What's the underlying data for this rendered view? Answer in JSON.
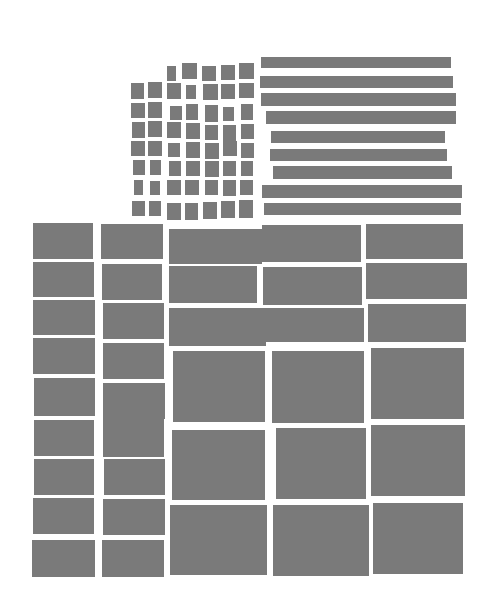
{
  "artwork": {
    "background": "#ffffff",
    "fill": "#7a7a7a",
    "small_squares": {
      "cols_x": [
        131,
        148,
        167,
        185,
        203,
        221,
        239
      ],
      "size": 15,
      "cells": [
        [
          167,
          66,
          9,
          15
        ],
        [
          182,
          63,
          15,
          16
        ],
        [
          202,
          66,
          14,
          15
        ],
        [
          221,
          65,
          14,
          15
        ],
        [
          239,
          63,
          15,
          16
        ],
        [
          131,
          83,
          13,
          16
        ],
        [
          148,
          82,
          14,
          16
        ],
        [
          167,
          83,
          14,
          16
        ],
        [
          186,
          85,
          10,
          14
        ],
        [
          203,
          84,
          15,
          16
        ],
        [
          221,
          84,
          14,
          15
        ],
        [
          239,
          83,
          15,
          15
        ],
        [
          131,
          103,
          14,
          15
        ],
        [
          148,
          102,
          14,
          16
        ],
        [
          170,
          106,
          12,
          14
        ],
        [
          186,
          104,
          12,
          16
        ],
        [
          205,
          105,
          13,
          17
        ],
        [
          223,
          107,
          11,
          14
        ],
        [
          241,
          104,
          12,
          16
        ],
        [
          132,
          122,
          13,
          16
        ],
        [
          148,
          121,
          14,
          16
        ],
        [
          167,
          122,
          14,
          16
        ],
        [
          186,
          123,
          14,
          16
        ],
        [
          205,
          125,
          13,
          15
        ],
        [
          223,
          125,
          13,
          16
        ],
        [
          241,
          124,
          13,
          15
        ],
        [
          131,
          141,
          14,
          15
        ],
        [
          148,
          141,
          14,
          15
        ],
        [
          168,
          143,
          12,
          14
        ],
        [
          186,
          142,
          14,
          16
        ],
        [
          205,
          143,
          14,
          16
        ],
        [
          223,
          141,
          14,
          15
        ],
        [
          241,
          143,
          13,
          15
        ],
        [
          133,
          160,
          12,
          15
        ],
        [
          150,
          160,
          11,
          15
        ],
        [
          169,
          161,
          12,
          15
        ],
        [
          186,
          161,
          14,
          15
        ],
        [
          205,
          161,
          14,
          16
        ],
        [
          223,
          161,
          13,
          15
        ],
        [
          241,
          161,
          12,
          15
        ],
        [
          134,
          180,
          9,
          15
        ],
        [
          150,
          181,
          10,
          14
        ],
        [
          167,
          180,
          14,
          15
        ],
        [
          185,
          180,
          14,
          15
        ],
        [
          205,
          180,
          13,
          15
        ],
        [
          223,
          180,
          13,
          16
        ],
        [
          240,
          180,
          13,
          15
        ],
        [
          132,
          201,
          13,
          15
        ],
        [
          149,
          201,
          12,
          15
        ],
        [
          167,
          203,
          14,
          17
        ],
        [
          185,
          203,
          13,
          17
        ],
        [
          203,
          202,
          14,
          17
        ],
        [
          221,
          201,
          14,
          17
        ],
        [
          239,
          200,
          14,
          18
        ]
      ]
    },
    "bars": [
      [
        261,
        57,
        190,
        11
      ],
      [
        260,
        76,
        193,
        12
      ],
      [
        261,
        93,
        195,
        13
      ],
      [
        266,
        111,
        190,
        13
      ],
      [
        271,
        131,
        174,
        12
      ],
      [
        270,
        149,
        177,
        12
      ],
      [
        273,
        166,
        179,
        13
      ],
      [
        262,
        185,
        200,
        13
      ],
      [
        264,
        203,
        197,
        12
      ]
    ],
    "left_columns": [
      [
        33,
        223,
        60,
        36
      ],
      [
        33,
        262,
        61,
        35
      ],
      [
        33,
        300,
        62,
        35
      ],
      [
        33,
        338,
        62,
        36
      ],
      [
        34,
        378,
        61,
        38
      ],
      [
        34,
        420,
        60,
        36
      ],
      [
        34,
        459,
        60,
        36
      ],
      [
        33,
        498,
        61,
        36
      ],
      [
        32,
        540,
        63,
        37
      ],
      [
        101,
        224,
        62,
        35
      ],
      [
        102,
        264,
        60,
        36
      ],
      [
        103,
        303,
        61,
        36
      ],
      [
        103,
        343,
        61,
        36
      ],
      [
        103,
        383,
        62,
        36
      ],
      [
        103,
        419,
        61,
        38
      ],
      [
        104,
        459,
        61,
        36
      ],
      [
        103,
        499,
        62,
        36
      ],
      [
        102,
        540,
        62,
        37
      ]
    ],
    "right_grid": [
      [
        169,
        229,
        93,
        35
      ],
      [
        262,
        225,
        99,
        37
      ],
      [
        366,
        224,
        97,
        35
      ],
      [
        169,
        266,
        88,
        37
      ],
      [
        263,
        267,
        99,
        38
      ],
      [
        366,
        263,
        101,
        36
      ],
      [
        169,
        308,
        97,
        38
      ],
      [
        263,
        308,
        101,
        34
      ],
      [
        368,
        304,
        98,
        38
      ],
      [
        173,
        351,
        92,
        71
      ],
      [
        272,
        351,
        92,
        72
      ],
      [
        371,
        348,
        93,
        71
      ],
      [
        172,
        430,
        93,
        70
      ],
      [
        276,
        428,
        90,
        71
      ],
      [
        371,
        425,
        94,
        71
      ],
      [
        170,
        505,
        97,
        70
      ],
      [
        273,
        505,
        96,
        71
      ],
      [
        373,
        503,
        90,
        71
      ]
    ]
  }
}
